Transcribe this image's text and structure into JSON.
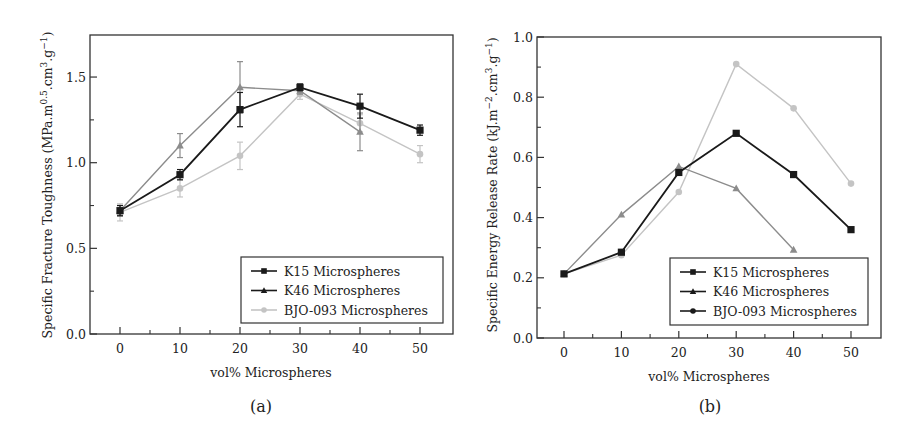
{
  "chart_data": [
    {
      "panel": "(a)",
      "type": "line",
      "title": "",
      "xlabel": "vol% Microspheres",
      "ylabel": "Specific Fracture Toughness (MPa.m^0.5.cm^3.g^-1)",
      "ylabel_parts": {
        "pre": "Specific Fracture Toughness (MPa.m",
        "sup1": "0.5",
        "mid": ".cm",
        "sup2": "3",
        "mid2": ".g",
        "sup3": "−1",
        "post": ")"
      },
      "xlim": [
        -5,
        55
      ],
      "ylim": [
        0,
        1.75
      ],
      "x_ticks": [
        0,
        10,
        20,
        30,
        40,
        50
      ],
      "x_tick_labels": [
        "0",
        "10",
        "20",
        "30",
        "40",
        "50"
      ],
      "y_ticks": [
        0.0,
        0.5,
        1.0,
        1.5
      ],
      "y_tick_labels": [
        "0.0",
        "0.5",
        "1.0",
        "1.5"
      ],
      "grid": false,
      "legend_position": "lower right",
      "x": [
        0,
        10,
        20,
        30,
        40,
        50
      ],
      "series": [
        {
          "name": "K15 Microspheres",
          "marker": "square",
          "color": "#1a1a1a",
          "x": [
            0,
            10,
            20,
            30,
            40,
            50
          ],
          "values": [
            0.72,
            0.93,
            1.31,
            1.44,
            1.33,
            1.19
          ],
          "errors": [
            0.03,
            0.03,
            0.1,
            0.02,
            0.07,
            0.03
          ]
        },
        {
          "name": "K46 Microspheres",
          "marker": "triangle",
          "color": "#8c8c8c",
          "x": [
            0,
            10,
            20,
            30,
            40
          ],
          "values": [
            0.72,
            1.1,
            1.44,
            1.42,
            1.18
          ],
          "errors": [
            0.03,
            0.07,
            0.15,
            0.02,
            0.11
          ]
        },
        {
          "name": "BJO-093 Microspheres",
          "marker": "circle",
          "color": "#c4c4c4",
          "x": [
            0,
            10,
            20,
            30,
            40,
            50
          ],
          "values": [
            0.71,
            0.85,
            1.04,
            1.4,
            1.23,
            1.05
          ],
          "errors": [
            0.05,
            0.05,
            0.08,
            0.03,
            0.05,
            0.05
          ]
        }
      ],
      "legend_colors": [
        "#1a1a1a",
        "#1a1a1a",
        "#c4c4c4"
      ]
    },
    {
      "panel": "(b)",
      "type": "line",
      "title": "",
      "xlabel": "vol% Microspheres",
      "ylabel": "Specific Energy Release Rate (kJ.m^-2.cm^3.g^-1)",
      "ylabel_parts": {
        "pre": "Specific Energy Release Rate (kJ.m",
        "sup1": "−2",
        "mid": ".cm",
        "sup2": "3",
        "mid2": ".g",
        "sup3": "−1",
        "post": ")"
      },
      "xlim": [
        -5,
        55
      ],
      "ylim": [
        0,
        1.0
      ],
      "x_ticks": [
        0,
        10,
        20,
        30,
        40,
        50
      ],
      "x_tick_labels": [
        "0",
        "10",
        "20",
        "30",
        "40",
        "50"
      ],
      "y_ticks": [
        0.0,
        0.2,
        0.4,
        0.6,
        0.8,
        1.0
      ],
      "y_tick_labels": [
        "0.0",
        "0.2",
        "0.4",
        "0.6",
        "0.8",
        "1.0"
      ],
      "grid": false,
      "legend_position": "lower right",
      "x": [
        0,
        10,
        20,
        30,
        40,
        50
      ],
      "series": [
        {
          "name": "K15 Microspheres",
          "marker": "square",
          "color": "#1a1a1a",
          "x": [
            0,
            10,
            20,
            30,
            40,
            50
          ],
          "values": [
            0.213,
            0.285,
            0.55,
            0.68,
            0.543,
            0.36
          ]
        },
        {
          "name": "K46 Microspheres",
          "marker": "triangle",
          "color": "#8c8c8c",
          "x": [
            0,
            10,
            20,
            30,
            40
          ],
          "values": [
            0.213,
            0.41,
            0.57,
            0.497,
            0.293
          ]
        },
        {
          "name": "BJO-093 Microspheres",
          "marker": "circle",
          "color": "#c4c4c4",
          "x": [
            0,
            10,
            20,
            30,
            40,
            50
          ],
          "values": [
            0.213,
            0.275,
            0.485,
            0.91,
            0.763,
            0.513
          ]
        }
      ],
      "legend_colors": [
        "#1a1a1a",
        "#1a1a1a",
        "#1a1a1a"
      ]
    }
  ],
  "panels": [
    {
      "label": "(a)",
      "xlabel": "vol% Microspheres"
    },
    {
      "label": "(b)",
      "xlabel": "vol% Microspheres"
    }
  ]
}
